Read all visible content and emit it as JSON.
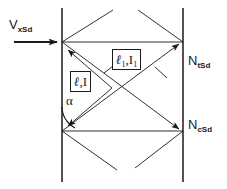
{
  "diagram": {
    "colors": {
      "line": "#1a1a1a",
      "background": "#ffffff",
      "text": "#1a1a1a"
    },
    "labels": {
      "incident": {
        "base": "V",
        "sub": "xSd"
      },
      "top_right": {
        "base": "N",
        "sub": "tSd"
      },
      "bottom_right": {
        "base": "N",
        "sub": "cSd"
      },
      "angle": "α"
    },
    "boxed_labels": {
      "upper": {
        "symbol": "ℓ",
        "symbol_sub": "1",
        "comma": ",",
        "current": "I",
        "current_sub": "1"
      },
      "lower": {
        "symbol": "ℓ",
        "symbol_sub": "",
        "comma": ",",
        "current": "I",
        "current_sub": ""
      }
    },
    "geometry": {
      "left_wall_x": 62,
      "right_wall_x": 183,
      "wall_top_y": 8,
      "wall_bottom_y": 182,
      "top_vertex_y": 42,
      "bottom_vertex_y": 131,
      "arrow_in_y": 42,
      "arrow_in_x_start": 14,
      "arrow_in_x_end": 60
    }
  }
}
